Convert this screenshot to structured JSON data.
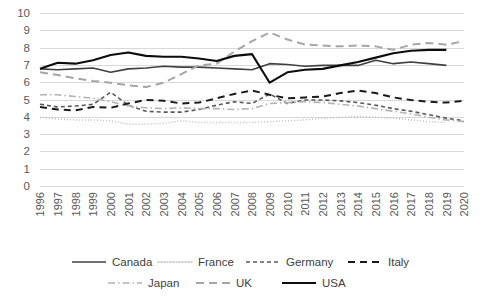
{
  "chart_data": {
    "type": "line",
    "title": "",
    "xlabel": "",
    "ylabel": "",
    "ylim": [
      0,
      10
    ],
    "ytick_step": 1,
    "grid": true,
    "legend_position": "bottom",
    "yticks": [
      "0",
      "1",
      "2",
      "3",
      "4",
      "5",
      "6",
      "7",
      "8",
      "9",
      "10"
    ],
    "categories": [
      "1996",
      "1997",
      "1998",
      "1999",
      "2000",
      "2001",
      "2002",
      "2003",
      "2004",
      "2005",
      "2006",
      "2007",
      "2008",
      "2009",
      "2010",
      "2011",
      "2012",
      "2013",
      "2014",
      "2015",
      "2016",
      "2017",
      "2018",
      "2019",
      "2020"
    ],
    "series": [
      {
        "name": "Canada",
        "style": "solid",
        "color": "#404040",
        "width": 1.6,
        "values": [
          6.8,
          6.75,
          6.8,
          6.85,
          6.6,
          6.8,
          6.85,
          6.95,
          6.9,
          6.9,
          6.85,
          6.8,
          6.75,
          7.1,
          7.05,
          6.95,
          7.0,
          7.0,
          7.0,
          7.3,
          7.1,
          7.2,
          7.1,
          7.0,
          null
        ]
      },
      {
        "name": "France",
        "style": "dotted",
        "color": "#bfbfbf",
        "width": 1.5,
        "values": [
          4.0,
          3.9,
          3.85,
          3.85,
          3.8,
          3.6,
          3.6,
          3.65,
          3.8,
          3.7,
          3.7,
          3.7,
          3.7,
          3.75,
          3.8,
          3.85,
          3.95,
          4.0,
          4.05,
          4.0,
          3.95,
          3.85,
          3.75,
          3.7,
          null
        ]
      },
      {
        "name": "Germany",
        "style": "dashed-short",
        "color": "#595959",
        "width": 1.6,
        "values": [
          4.75,
          4.6,
          4.65,
          4.75,
          5.45,
          4.7,
          4.35,
          4.3,
          4.3,
          4.45,
          4.7,
          4.9,
          4.8,
          5.35,
          4.8,
          5.0,
          5.0,
          4.95,
          4.85,
          4.7,
          4.5,
          4.35,
          4.15,
          3.95,
          3.8
        ]
      },
      {
        "name": "Italy",
        "style": "dashed-long",
        "color": "#1a1a1a",
        "width": 2.0,
        "values": [
          4.6,
          4.45,
          4.4,
          4.6,
          4.55,
          4.8,
          5.0,
          4.95,
          4.8,
          4.85,
          5.1,
          5.35,
          5.55,
          5.3,
          5.1,
          5.15,
          5.2,
          5.4,
          5.55,
          5.4,
          5.15,
          5.0,
          4.9,
          4.85,
          4.95
        ]
      },
      {
        "name": "Japan",
        "style": "dash-dot",
        "color": "#b3b3b3",
        "width": 1.6,
        "values": [
          5.3,
          5.3,
          5.2,
          5.1,
          4.9,
          4.65,
          4.55,
          4.5,
          4.55,
          4.5,
          4.5,
          4.45,
          4.5,
          4.8,
          4.85,
          4.9,
          4.85,
          4.75,
          4.65,
          4.5,
          4.35,
          4.2,
          4.0,
          3.85,
          3.75
        ]
      },
      {
        "name": "UK",
        "style": "dashed-medium",
        "color": "#a6a6a6",
        "width": 2.0,
        "values": [
          6.6,
          6.45,
          6.25,
          6.1,
          6.0,
          5.85,
          5.75,
          6.0,
          6.5,
          7.0,
          7.1,
          7.8,
          8.4,
          8.9,
          8.5,
          8.2,
          8.15,
          8.1,
          8.15,
          8.1,
          7.9,
          8.2,
          8.3,
          8.2,
          8.4
        ]
      },
      {
        "name": "USA",
        "style": "solid",
        "color": "#0d0d0d",
        "width": 2.1,
        "values": [
          6.8,
          7.15,
          7.1,
          7.3,
          7.6,
          7.75,
          7.55,
          7.5,
          7.5,
          7.4,
          7.25,
          7.55,
          7.65,
          6.0,
          6.6,
          6.75,
          6.8,
          7.0,
          7.2,
          7.45,
          7.7,
          7.85,
          7.9,
          7.9,
          null
        ]
      }
    ]
  },
  "legend": {
    "items": [
      {
        "label": "Canada"
      },
      {
        "label": "France"
      },
      {
        "label": "Germany"
      },
      {
        "label": "Italy"
      },
      {
        "label": "Japan"
      },
      {
        "label": "UK"
      },
      {
        "label": "USA"
      }
    ]
  }
}
